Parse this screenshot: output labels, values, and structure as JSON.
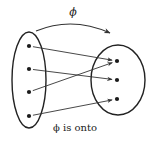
{
  "diagram": {
    "function_label": "ϕ",
    "caption": "ϕ is onto",
    "domain_set": {
      "ellipse": {
        "cx": 29,
        "cy": 80,
        "rx": 17,
        "ry": 48
      },
      "elements": [
        {
          "id": "a1",
          "x": 29,
          "y": 46
        },
        {
          "id": "a2",
          "x": 29,
          "y": 69
        },
        {
          "id": "a3",
          "x": 29,
          "y": 92
        },
        {
          "id": "a4",
          "x": 29,
          "y": 116
        }
      ]
    },
    "codomain_set": {
      "ellipse": {
        "cx": 118,
        "cy": 80,
        "rx": 27,
        "ry": 35
      },
      "elements": [
        {
          "id": "b1",
          "x": 117,
          "y": 61
        },
        {
          "id": "b2",
          "x": 117,
          "y": 80
        },
        {
          "id": "b3",
          "x": 117,
          "y": 99
        }
      ]
    },
    "mappings": [
      {
        "from": "a1",
        "to": "b1"
      },
      {
        "from": "a2",
        "to": "b2"
      },
      {
        "from": "a3",
        "to": "b1"
      },
      {
        "from": "a4",
        "to": "b3"
      }
    ],
    "colors": {
      "stroke": "#222222",
      "background": "#ffffff"
    }
  }
}
